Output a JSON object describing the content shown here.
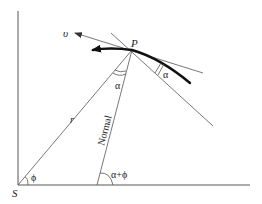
{
  "diagram": {
    "labels": {
      "origin": "S",
      "point": "P",
      "velocity": "υ",
      "radius": "r",
      "normal": "Normal",
      "angle_phi": "ϕ",
      "angle_alpha_at_P": "α",
      "angle_alpha_tangent": "α",
      "angle_alpha_plus_phi": "α+ϕ"
    },
    "colors": {
      "line": "#555555",
      "curve": "#111111",
      "background": "#ffffff"
    }
  }
}
